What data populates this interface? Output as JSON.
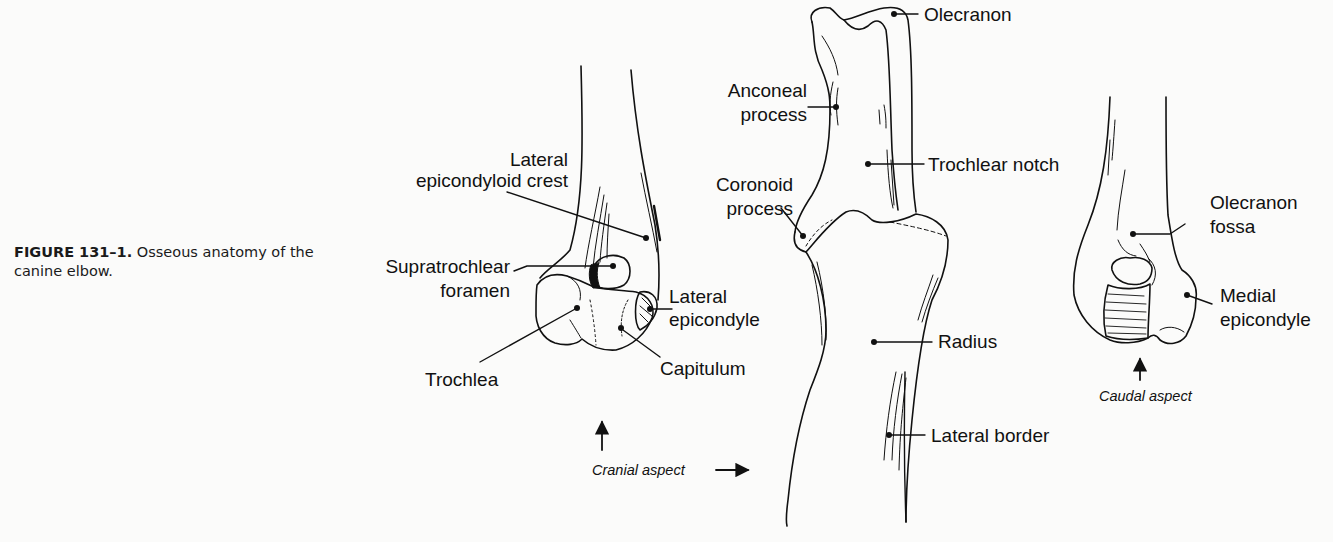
{
  "caption": {
    "figure_number": "FIGURE 131–1.",
    "text": " Osseous anatomy of the canine elbow."
  },
  "views": {
    "cranial": {
      "aspect_label": "Cranial aspect",
      "labels": {
        "lateral_epicondyloid_crest_1": "Lateral",
        "lateral_epicondyloid_crest_2": "epicondyloid crest",
        "supratrochlear_foramen_1": "Supratrochlear",
        "supratrochlear_foramen_2": "foramen",
        "lateral_epicondyle_1": "Lateral",
        "lateral_epicondyle_2": "epicondyle",
        "trochlea": "Trochlea",
        "capitulum": "Capitulum"
      }
    },
    "lateral": {
      "labels": {
        "olecranon": "Olecranon",
        "anconeal_process_1": "Anconeal",
        "anconeal_process_2": "process",
        "trochlear_notch": "Trochlear notch",
        "coronoid_process_1": "Coronoid",
        "coronoid_process_2": "process",
        "radius": "Radius",
        "lateral_border": "Lateral border"
      }
    },
    "caudal": {
      "aspect_label": "Caudal aspect",
      "labels": {
        "olecranon_fossa_1": "Olecranon",
        "olecranon_fossa_2": "fossa",
        "medial_epicondyle_1": "Medial",
        "medial_epicondyle_2": "epicondyle"
      }
    }
  }
}
